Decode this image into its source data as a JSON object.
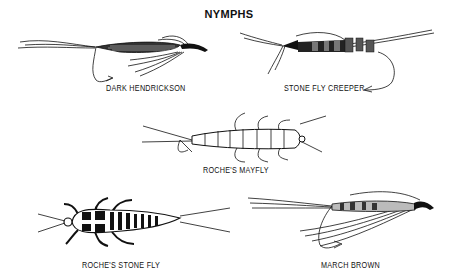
{
  "title": "NYMPHS",
  "flies": [
    {
      "name": "DARK HENDRICKSON"
    },
    {
      "name": "STONE FLY CREEPER"
    },
    {
      "name": "ROCHE'S MAYFLY"
    },
    {
      "name": "ROCHE'S STONE FLY"
    },
    {
      "name": "MARCH BROWN"
    }
  ]
}
